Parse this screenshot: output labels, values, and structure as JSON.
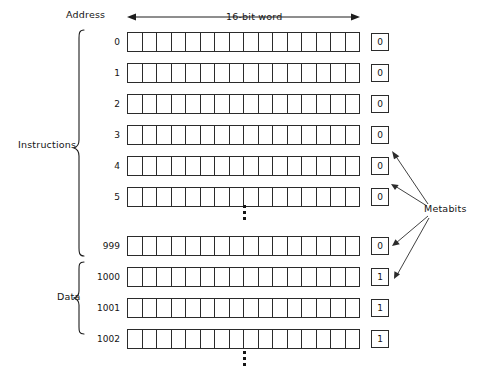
{
  "diagram": {
    "header": {
      "address_label": "Address",
      "word_label": "16-bit word",
      "metabits_label": "Metabits"
    },
    "groups": [
      {
        "name": "instructions-group",
        "label": "Instructions"
      },
      {
        "name": "data-group",
        "label": "Data"
      }
    ],
    "bits_per_word": 16,
    "rows": [
      {
        "address": "0",
        "metabit": "0",
        "group": "Instructions"
      },
      {
        "address": "1",
        "metabit": "0",
        "group": "Instructions"
      },
      {
        "address": "2",
        "metabit": "0",
        "group": "Instructions"
      },
      {
        "address": "3",
        "metabit": "0",
        "group": "Instructions"
      },
      {
        "address": "4",
        "metabit": "0",
        "group": "Instructions"
      },
      {
        "address": "5",
        "metabit": "0",
        "group": "Instructions"
      },
      {
        "address": "999",
        "metabit": "0",
        "group": "Instructions"
      },
      {
        "address": "1000",
        "metabit": "1",
        "group": "Data"
      },
      {
        "address": "1001",
        "metabit": "1",
        "group": "Data"
      },
      {
        "address": "1002",
        "metabit": "1",
        "group": "Data"
      }
    ],
    "ellipses": [
      {
        "name": "instructions-ellipsis",
        "glyph": "⋮"
      },
      {
        "name": "data-ellipsis",
        "glyph": "⋮"
      }
    ],
    "colors": {
      "ink": "#141414",
      "line": "#2b2b2b",
      "background": "#ffffff"
    }
  }
}
